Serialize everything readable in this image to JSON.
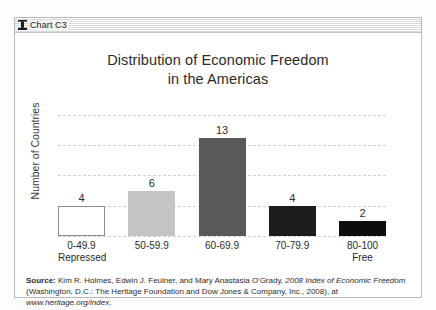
{
  "window": {
    "titlebar_label": "Chart C3",
    "titlebar_icon": "chart-window-icon"
  },
  "chart_data": {
    "type": "bar",
    "title": "Distribution of Economic Freedom in the Americas",
    "title_line1": "Distribution of Economic Freedom",
    "title_line2": "in the Americas",
    "xlabel": "",
    "ylabel": "Number of Countries",
    "categories": [
      "0-49.9",
      "50-59.9",
      "60-69.9",
      "70-79.9",
      "80-100"
    ],
    "category_sublabels": [
      "Repressed",
      "",
      "",
      "",
      "Free"
    ],
    "values": [
      4,
      6,
      13,
      4,
      2
    ],
    "value_labels": [
      "4",
      "6",
      "13",
      "4",
      "2"
    ],
    "bar_colors": [
      "#ffffff",
      "#c4c4c4",
      "#595959",
      "#1c1c1c",
      "#0d0d0d"
    ],
    "bar_border_colors": [
      "#8c8c8c",
      "#c4c4c4",
      "#595959",
      "#1c1c1c",
      "#0d0d0d"
    ],
    "ylim": [
      0,
      16
    ],
    "y_gridlines": [
      4,
      8,
      12,
      16
    ],
    "grid": true,
    "grid_color": "#d2d2d2",
    "legend": "none",
    "axis_tick_labels_visible": false
  },
  "source": {
    "label": "Source:",
    "line1_rest": " Kim R. Holmes, Edwin J. Feulner, and Mary Anastasia O'Grady, ",
    "line1_italic": "2008 Index of Economic",
    "line2_italic": "Freedom",
    "line2_rest": " (Washington, D.C.: The Heritage Foundation and Dow Jones & Company, Inc., 2008), at",
    "line3": "www.heritage.org/index."
  }
}
